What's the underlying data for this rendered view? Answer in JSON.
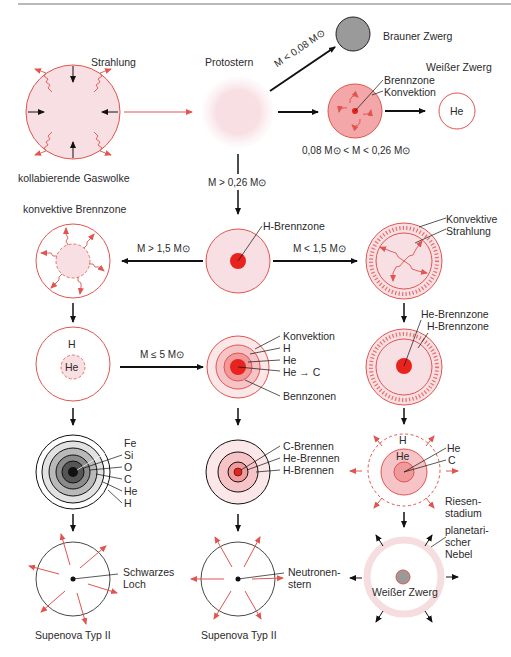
{
  "colors": {
    "red": "#e0554f",
    "pink_fill": "#f7dfe3",
    "pink_light": "#fbeef0",
    "core": "#e8221c",
    "dark": "#1a1a1a",
    "brown_dwarf": "#9a9a9a",
    "nebula": "#f6dde0"
  },
  "top": {
    "strahlung": "Strahlung",
    "gaswolke": "kollabierende Gaswolke",
    "protostern": "Protostern",
    "brown_cond": "M < 0,08 M⊙",
    "brauner_zwerg": "Brauner Zwerg",
    "weisser_zwerg": "Weißer Zwerg",
    "brennzone": "Brennzone",
    "konvektion": "Konvektion",
    "he": "He",
    "small_cond": "0,08 M⊙ < M < 0,26 M⊙",
    "main_cond": "M > 0,26 M⊙"
  },
  "middle": {
    "h_brennzone": "H-Brennzone",
    "big_cond": "M > 1,5 M⊙",
    "less_cond": "M < 1,5 M⊙",
    "konv_brennzone": "konvektive Brennzone",
    "konvektive": "Konvektive",
    "strahlung": "Strahlung",
    "h": "H",
    "he": "He",
    "le5_cond": "M ≤ 5 M⊙",
    "konvektion": "Konvektion",
    "h2": "H",
    "he2": "He",
    "he_c": "He → C",
    "bennzonen": "Bennzonen",
    "he_brennzone": "He-Brennzone",
    "h_brennzone2": "H-Brennzone"
  },
  "lower": {
    "shells": [
      "Fe",
      "Si",
      "O",
      "C",
      "He",
      "H"
    ],
    "c_brennen": "C-Brennen",
    "he_brennen": "He-Brennen",
    "h_brennen": "H-Brennen",
    "giant_h": "H",
    "giant_he": "He",
    "giant_he_lbl": "He",
    "giant_c_lbl": "C",
    "riesen": "Riesen-",
    "stadium": "stadium",
    "schwarzes": "Schwarzes",
    "loch": "Loch",
    "neutronen": "Neutronen-",
    "stern": "stern",
    "planetari": "planetari-",
    "scher": "scher",
    "nebel": "Nebel",
    "wz": "Weißer Zwerg",
    "sn1": "Supenova Typ II",
    "sn2": "Supenova Typ II"
  }
}
